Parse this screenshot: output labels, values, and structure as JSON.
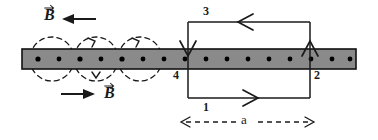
{
  "figure": {
    "colors": {
      "bar_fill": "#8a8a8a",
      "bar_stroke": "#111111",
      "line": "#1a1a1a",
      "dot": "#000000",
      "background": "#ffffff"
    },
    "conductor_bar": {
      "name": "current-carrying-wire",
      "x": 22,
      "y": 49,
      "width": 334,
      "height": 20,
      "dot_count": 16,
      "dot_radius": 2.4,
      "dot_note": "current out of page"
    },
    "field_circles": [
      {
        "cx": 52,
        "cy": 59,
        "r": 22
      },
      {
        "cx": 96,
        "cy": 59,
        "r": 22
      },
      {
        "cx": 140,
        "cy": 59,
        "r": 22
      }
    ],
    "labels": {
      "b_top": "B",
      "b_bottom": "B",
      "side_3": "3",
      "side_1": "1",
      "side_4": "4",
      "side_2": "2",
      "dimension_a": "a"
    },
    "loop": {
      "name": "rectangular-loop",
      "x": 188,
      "y": 22,
      "width": 122,
      "height": 76,
      "current_directions": {
        "top": "leftward",
        "bottom": "rightward",
        "left": "downward",
        "right": "upward"
      }
    },
    "arrows": {
      "b_top_direction": "left",
      "b_bottom_direction": "right"
    },
    "dimension": {
      "label": "a",
      "x_start": 182,
      "x_end": 315,
      "y": 122
    }
  }
}
